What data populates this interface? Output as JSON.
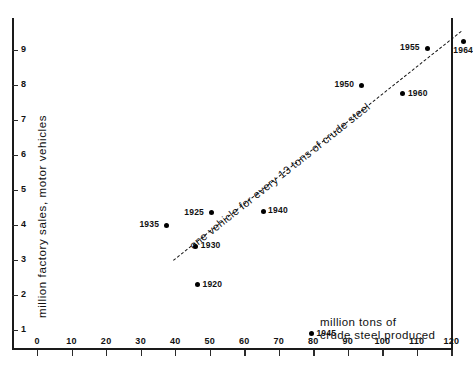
{
  "chart_data": {
    "type": "scatter",
    "title": "",
    "xlabel": "million tons of crude steel produced",
    "ylabel": "million factory sales, motor vehicles",
    "xlim": [
      0,
      127
    ],
    "ylim": [
      0,
      9.8
    ],
    "grid": false,
    "legend": "none",
    "x_ticks": [
      "0",
      "10",
      "20",
      "30",
      "40",
      "50",
      "60",
      "70",
      "80",
      "90",
      "100",
      "110",
      "120"
    ],
    "x_tick_values": [
      0,
      10,
      20,
      30,
      40,
      50,
      60,
      70,
      80,
      90,
      100,
      110,
      120
    ],
    "y_ticks": [
      "1",
      "2",
      "3",
      "4",
      "5",
      "6",
      "7",
      "8",
      "9"
    ],
    "y_tick_values": [
      1,
      2,
      3,
      4,
      5,
      6,
      7,
      8,
      9
    ],
    "points": [
      {
        "label": "1920",
        "x": 46.5,
        "y": 2.3,
        "label_side": "right"
      },
      {
        "label": "1925",
        "x": 50.5,
        "y": 4.35,
        "label_side": "left"
      },
      {
        "label": "1930",
        "x": 46.0,
        "y": 3.4,
        "label_side": "right"
      },
      {
        "label": "1935",
        "x": 37.5,
        "y": 4.0,
        "label_side": "left"
      },
      {
        "label": "1940",
        "x": 65.5,
        "y": 4.4,
        "label_side": "right"
      },
      {
        "label": "1945",
        "x": 79.5,
        "y": 0.9,
        "label_side": "right"
      },
      {
        "label": "1950",
        "x": 94.0,
        "y": 8.0,
        "label_side": "left"
      },
      {
        "label": "1955",
        "x": 113.0,
        "y": 9.05,
        "label_side": "left"
      },
      {
        "label": "1960",
        "x": 106.0,
        "y": 7.75,
        "label_side": "right"
      },
      {
        "label": "1964",
        "x": 123.5,
        "y": 9.25,
        "label_side": "below"
      }
    ],
    "trend_line": {
      "annotation": "one vehicle for every 13 tons of crude steel",
      "style": "dashed",
      "x_start": 39.5,
      "y_start": 3.0,
      "x_end": 123.0,
      "y_end": 9.55
    },
    "colors": {
      "axis": "#1a1a1a",
      "marker": "#000000",
      "text": "#111111"
    }
  }
}
